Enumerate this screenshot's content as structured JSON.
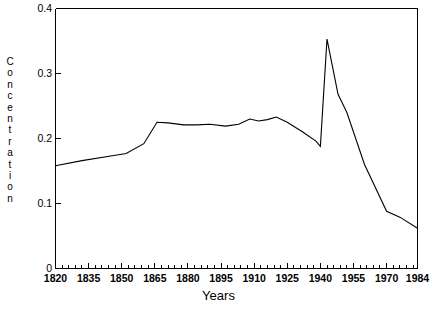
{
  "chart_data": {
    "type": "line",
    "title": "",
    "xlabel": "Years",
    "ylabel": "Concentration",
    "ylabel_letters": [
      "C",
      "o",
      "n",
      "c",
      "e",
      "n",
      "t",
      "r",
      "a",
      "t",
      "i",
      "o",
      "n"
    ],
    "xlim": [
      1820,
      1984
    ],
    "ylim": [
      0,
      0.4
    ],
    "grid": false,
    "legend": null,
    "x_tick_labels": [
      "1820",
      "1835",
      "1850",
      "1865",
      "1880",
      "1895",
      "1910",
      "1925",
      "1940",
      "1955",
      "1970",
      "1984"
    ],
    "x_tick_values": [
      1820,
      1835,
      1850,
      1865,
      1880,
      1895,
      1910,
      1925,
      1940,
      1955,
      1970,
      1984
    ],
    "x_minor_tick_step": 3,
    "y_tick_labels": [
      "0",
      "0.1",
      "0.2",
      "0.3",
      "0.4"
    ],
    "y_tick_values": [
      0,
      0.1,
      0.2,
      0.3,
      0.4
    ],
    "line_color": "#000000",
    "series": [
      {
        "name": "Concentration",
        "x": [
          1820,
          1832,
          1845,
          1852,
          1860,
          1866,
          1871,
          1878,
          1884,
          1890,
          1897,
          1903,
          1908,
          1912,
          1916,
          1920,
          1925,
          1932,
          1938,
          1940,
          1943,
          1948,
          1952,
          1960,
          1970,
          1976,
          1984
        ],
        "values": [
          0.158,
          0.166,
          0.173,
          0.177,
          0.192,
          0.225,
          0.224,
          0.221,
          0.221,
          0.222,
          0.219,
          0.222,
          0.23,
          0.227,
          0.229,
          0.233,
          0.225,
          0.21,
          0.196,
          0.188,
          0.353,
          0.268,
          0.24,
          0.16,
          0.088,
          0.079,
          0.062
        ]
      }
    ]
  }
}
